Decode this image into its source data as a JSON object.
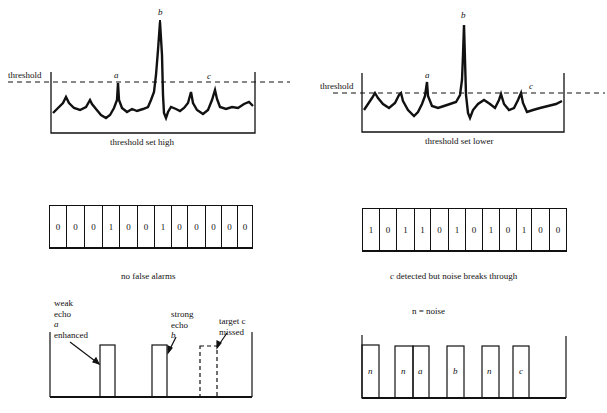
{
  "left_panel": {
    "threshold_label": "threshold",
    "trace_caption": "threshold set high",
    "peak_labels": {
      "a": "a",
      "b": "b",
      "c": "c"
    },
    "bits": [
      "0",
      "0",
      "0",
      "1",
      "0",
      "0",
      "1",
      "0",
      "0",
      "0",
      "0",
      "0"
    ],
    "bits_caption": "no false alarms",
    "annotations": {
      "weak_echo": [
        "weak",
        "echo",
        "a",
        "enhanced"
      ],
      "strong_echo": [
        "strong",
        "echo",
        "b"
      ],
      "missed": [
        "target c",
        "missed"
      ]
    }
  },
  "right_panel": {
    "threshold_label": "threshold",
    "trace_caption": "threshold set lower",
    "peak_labels": {
      "a": "a",
      "b": "b",
      "c": "c"
    },
    "bits": [
      "1",
      "0",
      "1",
      "1",
      "0",
      "1",
      "0",
      "1",
      "0",
      "1",
      "0",
      "0"
    ],
    "bits_caption_prefix": "c",
    "bits_caption": " detected but noise breaks through",
    "legend": "n = noise",
    "pulse_labels": [
      "n",
      "n",
      "a",
      "b",
      "n",
      "c"
    ]
  }
}
